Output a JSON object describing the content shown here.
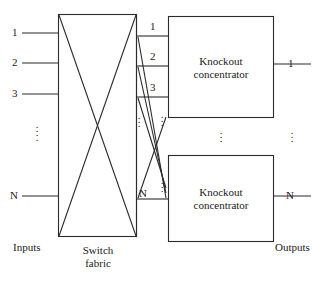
{
  "figure": {
    "line_color": "#2b2b2b",
    "background": "#ffffff"
  },
  "inputs": {
    "group_label": "Inputs",
    "lines": [
      {
        "label": "1",
        "y": 33
      },
      {
        "label": "2",
        "y": 63
      },
      {
        "label": "3",
        "y": 94
      },
      {
        "label": "N",
        "y": 196
      }
    ],
    "ellipsis": "⋮"
  },
  "switch_fabric": {
    "label_line1": "Switch",
    "label_line2": "fabric"
  },
  "bus": {
    "labels": [
      {
        "label": "1",
        "y": 33
      },
      {
        "label": "2",
        "y": 63
      },
      {
        "label": "3",
        "y": 94
      },
      {
        "label": "N",
        "y": 196
      }
    ],
    "ellipsis": "⋮"
  },
  "concentrators": [
    {
      "name": "knockout-concentrator-top",
      "label_line1": "Knockout",
      "label_line2": "concentrator"
    },
    {
      "name": "knockout-concentrator-bottom",
      "label_line1": "Knockout",
      "label_line2": "concentrator"
    }
  ],
  "outputs": {
    "group_label": "Outputs",
    "lines": [
      {
        "label": "1",
        "y": 64
      },
      {
        "label": "N",
        "y": 196
      }
    ],
    "ellipsis": "⋮"
  }
}
